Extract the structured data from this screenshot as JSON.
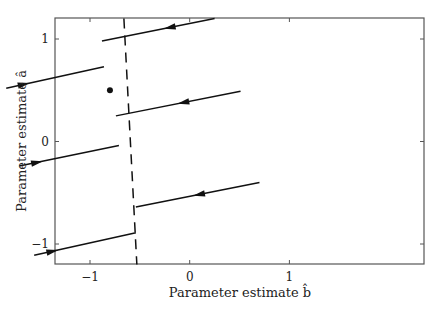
{
  "chart_data": {
    "type": "line",
    "title": "",
    "xlabel": "Parameter estimate b̂",
    "ylabel": "Parameter estimate â",
    "xlim": [
      -2.35,
      1.35
    ],
    "ylim": [
      -1.2,
      1.2
    ],
    "xticks": [
      -2,
      -1,
      0,
      1
    ],
    "xtick_labels": [
      "−2",
      "−1",
      "0",
      "1"
    ],
    "yticks": [
      -1,
      0,
      1
    ],
    "ytick_labels": [
      "−1",
      "0",
      "1"
    ],
    "grid": false,
    "legend": null,
    "switching_line": {
      "style": "dashed",
      "points": [
        [
          -0.66,
          1.2
        ],
        [
          -0.53,
          -1.2
        ]
      ]
    },
    "equilibrium_point": {
      "b": -0.8,
      "a": 0.5
    },
    "trajectories": [
      {
        "name": "left-1",
        "start": [
          -1.84,
          0.52
        ],
        "end": [
          -0.86,
          0.73
        ],
        "arrow_at": 0.18
      },
      {
        "name": "left-2",
        "start": [
          -1.71,
          -0.24
        ],
        "end": [
          -0.71,
          -0.04
        ],
        "arrow_at": 0.18
      },
      {
        "name": "left-3",
        "start": [
          -1.56,
          -1.11
        ],
        "end": [
          -0.54,
          -0.89
        ],
        "arrow_at": 0.18
      },
      {
        "name": "right-1",
        "start": [
          0.25,
          1.2
        ],
        "end": [
          -0.88,
          0.98
        ],
        "arrow_at": 0.4
      },
      {
        "name": "right-2",
        "start": [
          0.51,
          0.49
        ],
        "end": [
          -0.74,
          0.25
        ],
        "arrow_at": 0.46
      },
      {
        "name": "right-3",
        "start": [
          0.7,
          -0.4
        ],
        "end": [
          -0.54,
          -0.64
        ],
        "arrow_at": 0.49
      }
    ]
  },
  "colors": {
    "line": "#111111",
    "frame": "#555555",
    "background": "#ffffff"
  }
}
